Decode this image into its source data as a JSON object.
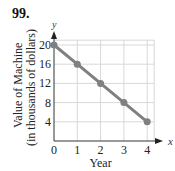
{
  "problem_number": "99.",
  "chart_data": {
    "type": "line",
    "x": [
      0,
      1,
      2,
      3,
      4
    ],
    "series": [
      {
        "name": "Value of Machine",
        "values": [
          20,
          16,
          12,
          8,
          4
        ]
      }
    ],
    "title": "",
    "xlabel": "Year",
    "ylabel": "Value of Machine (in thousands of dollars)",
    "ylabel_line1": "Value of Machine",
    "ylabel_line2": "(in thousands of dollars)",
    "x_axis_name": "x",
    "y_axis_name": "y",
    "xticks": [
      "0",
      "1",
      "2",
      "3",
      "4"
    ],
    "yticks": [
      "4",
      "8",
      "12",
      "16",
      "20"
    ],
    "xlim": [
      0,
      4.5
    ],
    "ylim": [
      0,
      22
    ],
    "grid": true,
    "colors": {
      "line": "#808080",
      "grid": "#d8d8d8"
    }
  }
}
